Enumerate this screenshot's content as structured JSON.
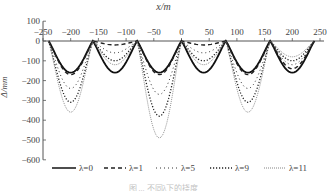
{
  "chart_data": {
    "type": "line",
    "title": "",
    "xlabel": "x/m",
    "ylabel": "Δ/mm",
    "xlim": [
      -250,
      250
    ],
    "ylim": [
      -600,
      100
    ],
    "x_ticks": [
      -250,
      -200,
      -150,
      -100,
      -50,
      0,
      50,
      100,
      150,
      200,
      250
    ],
    "x_tick_labels": [
      "−250",
      "−200",
      "−150",
      "−100",
      "−50",
      "0",
      "50",
      "100",
      "150",
      "200",
      "250"
    ],
    "y_ticks": [
      100,
      0,
      -100,
      -200,
      -300,
      -400,
      -500,
      -600
    ],
    "y_tick_labels": [
      "100",
      "0",
      "−100",
      "−200",
      "−300",
      "−400",
      "−500",
      "−600"
    ],
    "x_axis_position": "top",
    "grid": false,
    "legend_position": "bottom",
    "supports_x": [
      -240,
      -160,
      -80,
      0,
      80,
      160,
      240
    ],
    "span_centers": [
      -200,
      -120,
      -40,
      40,
      120,
      200
    ],
    "series": [
      {
        "name": "λ=0",
        "style": "solid",
        "span_min": [
          -160,
          -160,
          -160,
          -160,
          -160,
          -160
        ]
      },
      {
        "name": "λ=1",
        "style": "dashed",
        "span_min": [
          -170,
          -20,
          -170,
          -20,
          -170,
          -140
        ]
      },
      {
        "name": "λ=5",
        "style": "dotted",
        "span_min": [
          -240,
          -60,
          -270,
          -60,
          -240,
          -120
        ]
      },
      {
        "name": "λ=9",
        "style": "dense-dotted",
        "span_min": [
          -310,
          -100,
          -380,
          -100,
          -310,
          -100
        ]
      },
      {
        "name": "λ=11",
        "style": "fine-dotted",
        "span_min": [
          -360,
          -120,
          -490,
          -120,
          -360,
          -80
        ]
      }
    ]
  },
  "axis": {
    "xlabel": "x/m",
    "ylabel": "Δ/mm"
  },
  "legend": [
    {
      "label": "λ=0"
    },
    {
      "label": "λ=1"
    },
    {
      "label": "λ=5"
    },
    {
      "label": "λ=9"
    },
    {
      "label": "λ=11"
    }
  ],
  "caption": "图 ... 不同λ下的挠度"
}
